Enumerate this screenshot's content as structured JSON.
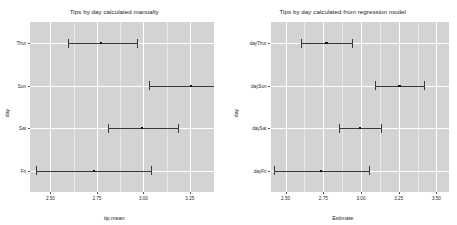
{
  "figure": {
    "background": "#ffffff",
    "panel_background": "#d3d3d3",
    "grid_color": "#ffffff",
    "point_color": "#111111",
    "errorbar_color": "#3a3a3a"
  },
  "chart_data": [
    {
      "type": "scatter",
      "panel": "left",
      "title": "Tips by day calculated manually",
      "xlabel": "tip.mean",
      "ylabel": "day",
      "categories": [
        "Thur",
        "Sun",
        "Sat",
        "Fri"
      ],
      "xticks": [
        "2.50",
        "2.75",
        "3.00",
        "3.25"
      ],
      "xtick_values": [
        2.5,
        2.75,
        3.0,
        3.25
      ],
      "xlim": [
        2.39,
        3.38
      ],
      "grid": true,
      "legend": "none",
      "series": [
        {
          "name": "tip.mean",
          "points": [
            {
              "category": "Thur",
              "estimate": 2.771,
              "low": 2.594,
              "high": 2.964
            },
            {
              "category": "Sun",
              "estimate": 3.255,
              "low": 3.03,
              "high": 3.47
            },
            {
              "category": "Sat",
              "estimate": 2.993,
              "low": 2.81,
              "high": 3.185
            },
            {
              "category": "Fri",
              "estimate": 2.735,
              "low": 2.42,
              "high": 3.04
            }
          ]
        }
      ]
    },
    {
      "type": "scatter",
      "panel": "right",
      "title": "Tips by day calculated from regression model",
      "xlabel": "Estimate",
      "ylabel": "day",
      "categories": [
        "dayThur",
        "daySun",
        "daySat",
        "dayFri"
      ],
      "xticks": [
        "2.50",
        "2.75",
        "3.00",
        "3.25",
        "3.50"
      ],
      "xtick_values": [
        2.5,
        2.75,
        3.0,
        3.25,
        3.5
      ],
      "xlim": [
        2.4,
        3.58
      ],
      "grid": true,
      "legend": "none",
      "series": [
        {
          "name": "Estimate",
          "points": [
            {
              "category": "dayThur",
              "estimate": 2.771,
              "low": 2.602,
              "high": 2.94
            },
            {
              "category": "daySun",
              "estimate": 3.255,
              "low": 3.09,
              "high": 3.42
            },
            {
              "category": "daySat",
              "estimate": 2.993,
              "low": 2.855,
              "high": 3.13
            },
            {
              "category": "dayFri",
              "estimate": 2.735,
              "low": 2.42,
              "high": 3.05
            }
          ]
        }
      ]
    }
  ]
}
